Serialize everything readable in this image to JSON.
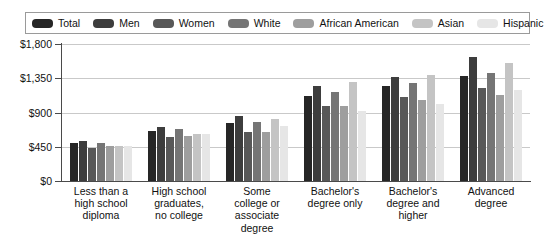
{
  "legend": {
    "items": [
      {
        "label": "Total",
        "color": "#262626"
      },
      {
        "label": "Men",
        "color": "#3d3d3d"
      },
      {
        "label": "Women",
        "color": "#585858"
      },
      {
        "label": "White",
        "color": "#757575"
      },
      {
        "label": "African American",
        "color": "#9e9e9e"
      },
      {
        "label": "Asian",
        "color": "#c4c4c4"
      },
      {
        "label": "Hispanic",
        "color": "#e6e6e6"
      }
    ]
  },
  "axis": {
    "y_ticks": [
      "$0",
      "$450",
      "$900",
      "$1,350",
      "$1,800"
    ],
    "y_tick_values": [
      0,
      450,
      900,
      1350,
      1800
    ]
  },
  "chart_data": {
    "type": "bar",
    "title": "",
    "subtitle": "",
    "xlabel": "",
    "ylabel": "",
    "ylim": [
      0,
      1800
    ],
    "ytick_labels": [
      "$0",
      "$450",
      "$900",
      "$1,350",
      "$1,800"
    ],
    "grid": true,
    "legend_position": "top",
    "categories": [
      "Less than a high school diploma",
      "High school graduates, no college",
      "Some college or associate degree",
      "Bachelor's degree only",
      "Bachelor's degree and higher",
      "Advanced degree"
    ],
    "category_lines": [
      [
        "Less than a",
        "high school",
        "diploma"
      ],
      [
        "High school",
        "graduates,",
        "no college"
      ],
      [
        "Some",
        "college or",
        "associate degree"
      ],
      [
        "Bachelor's",
        "degree only"
      ],
      [
        "Bachelor's",
        "degree and",
        "higher"
      ],
      [
        "Advanced",
        "degree"
      ]
    ],
    "series": [
      {
        "name": "Total",
        "color": "#262626",
        "values": [
          493,
          660,
          756,
          1123,
          1248,
          1386
        ]
      },
      {
        "name": "Men",
        "color": "#3d3d3d",
        "values": [
          520,
          712,
          856,
          1246,
          1369,
          1630
        ]
      },
      {
        "name": "Women",
        "color": "#585858",
        "values": [
          430,
          578,
          638,
          988,
          1101,
          1220
        ]
      },
      {
        "name": "White",
        "color": "#757575",
        "values": [
          501,
          679,
          776,
          1163,
          1285,
          1420
        ]
      },
      {
        "name": "African American",
        "color": "#9e9e9e",
        "values": [
          459,
          592,
          650,
          990,
          1066,
          1136
        ]
      },
      {
        "name": "Asian",
        "color": "#c4c4c4",
        "values": [
          466,
          617,
          812,
          1305,
          1392,
          1545
        ]
      },
      {
        "name": "Hispanic",
        "color": "#e6e6e6",
        "values": [
          460,
          617,
          718,
          925,
          1013,
          1200
        ]
      }
    ]
  }
}
